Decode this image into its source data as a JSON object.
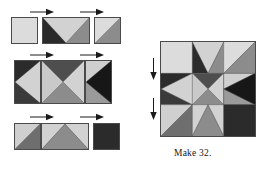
{
  "figure": {
    "kind": "quilt-block-assembly-diagram",
    "caption": "Make 32.",
    "palette": {
      "light": "#dcdcdc",
      "light_alt": "#d2d2d2",
      "medium": "#8c8c8c",
      "medium_dark": "#6e6e6e",
      "dark": "#2b2b2b",
      "black": "#171717",
      "outline": "#4a4a4a",
      "background": "#ffffff",
      "text": "#161616"
    },
    "rows": [
      {
        "name": "top-row",
        "label": "Top row units",
        "units": [
          {
            "name": "corner-square-light",
            "type": "plain-square",
            "colors": [
              "light"
            ]
          },
          {
            "name": "flying-geese-down",
            "type": "flying-geese",
            "point": "down",
            "colors": [
              "light",
              "dark",
              "medium"
            ]
          },
          {
            "name": "half-square-triangle-light-medium",
            "type": "half-square-triangle",
            "colors": [
              "light",
              "medium"
            ]
          }
        ],
        "arrows": [
          {
            "name": "press-arrow-right-top-1",
            "direction": "right"
          },
          {
            "name": "press-arrow-right-top-2",
            "direction": "right"
          }
        ]
      },
      {
        "name": "middle-row",
        "label": "Middle row units",
        "units": [
          {
            "name": "flying-geese-right",
            "type": "flying-geese",
            "point": "right",
            "colors": [
              "light",
              "dark",
              "medium"
            ]
          },
          {
            "name": "quarter-square-triangle-center",
            "type": "quarter-square-triangle",
            "colors": [
              "dark",
              "light",
              "medium",
              "light"
            ]
          },
          {
            "name": "flying-geese-left",
            "type": "flying-geese",
            "point": "left",
            "colors": [
              "black",
              "light",
              "medium"
            ]
          }
        ],
        "arrows": [
          {
            "name": "press-arrow-right-middle-1",
            "direction": "right"
          },
          {
            "name": "press-arrow-right-middle-2",
            "direction": "right"
          }
        ]
      },
      {
        "name": "bottom-row",
        "label": "Bottom row units",
        "units": [
          {
            "name": "half-square-triangle-light-dark",
            "type": "half-square-triangle",
            "colors": [
              "light",
              "medium_dark"
            ]
          },
          {
            "name": "flying-geese-up",
            "type": "flying-geese",
            "point": "up",
            "colors": [
              "medium",
              "light",
              "light"
            ]
          },
          {
            "name": "corner-square-dark",
            "type": "plain-square",
            "colors": [
              "dark"
            ]
          }
        ],
        "arrows": [
          {
            "name": "press-arrow-right-bottom-1",
            "direction": "right"
          },
          {
            "name": "press-arrow-right-bottom-2",
            "direction": "right"
          }
        ]
      }
    ],
    "finished_block": {
      "name": "finished-block",
      "label": "Finished pieced block",
      "grid": "3x3",
      "arrows": [
        {
          "name": "press-arrow-down-block-1",
          "direction": "down"
        },
        {
          "name": "press-arrow-down-block-2",
          "direction": "down"
        }
      ]
    }
  }
}
